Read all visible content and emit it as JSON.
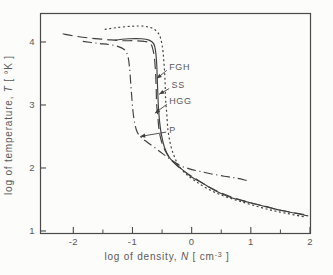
{
  "figure": {
    "background": "#fcfcfa",
    "line_color": "#3f3f3f",
    "axis_color": "#4a4a4a",
    "text_color": "#5a5a5a"
  },
  "chart_data": {
    "type": "line",
    "title": "",
    "xlabel": {
      "prefix": "log of density, ",
      "symbol": "N",
      "unit_open": "  [ cm",
      "unit_sup": "-3",
      "unit_close": " ]"
    },
    "ylabel": {
      "prefix": "log of temperature, ",
      "symbol": "T",
      "unit_open": "  [ °K ]",
      "unit_sup": "",
      "unit_close": ""
    },
    "x_axis": {
      "edge_min": -2.563,
      "edge_max": 2.0,
      "major_ticks": [
        -2,
        -1,
        0,
        1,
        2
      ],
      "minor_ticks": [
        -1.5,
        -0.5,
        0.5,
        1.5
      ],
      "grid": false
    },
    "y_axis": {
      "edge_min": 0.968,
      "edge_max": 4.46,
      "major_ticks": [
        1,
        2,
        3,
        4
      ],
      "minor_ticks": [],
      "grid": false
    },
    "legend_position": "in-plot-arrow-labels",
    "series": [
      {
        "name": "SS",
        "line_style": "dotted",
        "points": [
          [
            -1.47,
            4.2
          ],
          [
            -1.25,
            4.23
          ],
          [
            -1.0,
            4.25
          ],
          [
            -0.8,
            4.25
          ],
          [
            -0.65,
            4.21
          ],
          [
            -0.55,
            4.12
          ],
          [
            -0.5,
            3.95
          ],
          [
            -0.47,
            3.7
          ],
          [
            -0.45,
            3.4
          ],
          [
            -0.44,
            3.1
          ],
          [
            -0.42,
            2.85
          ],
          [
            -0.4,
            2.6
          ],
          [
            -0.36,
            2.38
          ],
          [
            -0.3,
            2.2
          ],
          [
            -0.22,
            2.04
          ],
          [
            -0.1,
            1.91
          ],
          [
            0.05,
            1.8
          ],
          [
            0.25,
            1.68
          ],
          [
            0.5,
            1.57
          ],
          [
            0.75,
            1.49
          ],
          [
            1.0,
            1.42
          ],
          [
            1.3,
            1.34
          ],
          [
            1.6,
            1.28
          ],
          [
            1.93,
            1.22
          ]
        ]
      },
      {
        "name": "HGG",
        "line_style": "long-dash",
        "points": [
          [
            -2.18,
            4.13
          ],
          [
            -1.95,
            4.09
          ],
          [
            -1.7,
            4.06
          ],
          [
            -1.45,
            4.04
          ],
          [
            -1.2,
            4.02
          ],
          [
            -0.98,
            4.02
          ],
          [
            -0.8,
            4.01
          ],
          [
            -0.7,
            3.98
          ],
          [
            -0.66,
            3.9
          ],
          [
            -0.63,
            3.75
          ],
          [
            -0.61,
            3.5
          ],
          [
            -0.6,
            3.25
          ],
          [
            -0.59,
            3.0
          ],
          [
            -0.57,
            2.8
          ],
          [
            -0.55,
            2.6
          ],
          [
            -0.51,
            2.42
          ],
          [
            -0.44,
            2.26
          ],
          [
            -0.35,
            2.13
          ],
          [
            -0.25,
            2.04
          ],
          [
            -0.1,
            1.93
          ],
          [
            0.1,
            1.81
          ],
          [
            0.35,
            1.67
          ],
          [
            0.64,
            1.55
          ],
          [
            0.95,
            1.46
          ],
          [
            1.25,
            1.39
          ],
          [
            1.55,
            1.32
          ],
          [
            1.97,
            1.25
          ]
        ]
      },
      {
        "name": "P",
        "line_style": "dash-dot",
        "points": [
          [
            -1.84,
            4.01
          ],
          [
            -1.6,
            3.98
          ],
          [
            -1.4,
            3.96
          ],
          [
            -1.25,
            3.93
          ],
          [
            -1.14,
            3.88
          ],
          [
            -1.08,
            3.78
          ],
          [
            -1.05,
            3.6
          ],
          [
            -1.03,
            3.35
          ],
          [
            -1.01,
            3.1
          ],
          [
            -0.99,
            2.88
          ],
          [
            -0.96,
            2.7
          ],
          [
            -0.92,
            2.57
          ],
          [
            -0.85,
            2.48
          ],
          [
            -0.75,
            2.41
          ],
          [
            -0.62,
            2.32
          ],
          [
            -0.48,
            2.22
          ],
          [
            -0.33,
            2.12
          ],
          [
            -0.2,
            2.04
          ],
          [
            -0.05,
            1.99
          ],
          [
            0.12,
            1.95
          ],
          [
            0.32,
            1.91
          ],
          [
            0.55,
            1.87
          ],
          [
            0.75,
            1.84
          ],
          [
            0.94,
            1.8
          ]
        ]
      },
      {
        "name": "FGH",
        "line_style": "solid",
        "points": [
          [
            -1.3,
            4.03
          ],
          [
            -1.05,
            4.05
          ],
          [
            -0.85,
            4.05
          ],
          [
            -0.72,
            4.03
          ],
          [
            -0.64,
            3.97
          ],
          [
            -0.61,
            3.85
          ],
          [
            -0.59,
            3.65
          ],
          [
            -0.58,
            3.4
          ],
          [
            -0.57,
            3.15
          ],
          [
            -0.56,
            2.95
          ],
          [
            -0.54,
            2.72
          ],
          [
            -0.51,
            2.52
          ],
          [
            -0.46,
            2.33
          ],
          [
            -0.38,
            2.17
          ],
          [
            -0.28,
            2.07
          ],
          [
            -0.18,
            1.99
          ],
          [
            -0.02,
            1.87
          ],
          [
            0.18,
            1.76
          ],
          [
            0.4,
            1.64
          ],
          [
            0.64,
            1.54
          ],
          [
            0.9,
            1.47
          ],
          [
            1.15,
            1.41
          ],
          [
            1.4,
            1.35
          ],
          [
            1.65,
            1.3
          ],
          [
            1.97,
            1.24
          ]
        ]
      }
    ],
    "annotations": [
      {
        "label": "FGH",
        "text_pos": [
          -0.38,
          3.6
        ],
        "arrow_from": [
          -0.42,
          3.55
        ],
        "arrow_to": [
          -0.59,
          3.42
        ]
      },
      {
        "label": "SS",
        "text_pos": [
          -0.34,
          3.31
        ],
        "arrow_from": [
          -0.38,
          3.26
        ],
        "arrow_to": [
          -0.55,
          3.17
        ]
      },
      {
        "label": "HGG",
        "text_pos": [
          -0.38,
          3.06
        ],
        "arrow_from": [
          -0.42,
          3.01
        ],
        "arrow_to": [
          -0.62,
          2.87
        ]
      },
      {
        "label": "P",
        "text_pos": [
          -0.38,
          2.6
        ],
        "arrow_from": [
          -0.43,
          2.57
        ],
        "arrow_to": [
          -0.87,
          2.5
        ]
      }
    ]
  }
}
